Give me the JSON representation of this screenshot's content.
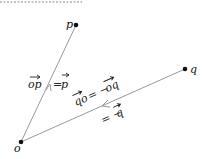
{
  "diagram": {
    "colors": {
      "line": "#9a9a9a",
      "point": "#111111",
      "text": "#222222",
      "dotted": "#b0b0b0"
    },
    "points": [
      {
        "id": "o",
        "label": "o",
        "x": 21,
        "y": 142
      },
      {
        "id": "p",
        "label": "p",
        "x": 76,
        "y": 25
      },
      {
        "id": "q",
        "label": "q",
        "x": 185,
        "y": 69
      }
    ],
    "segments": [
      {
        "from": "o",
        "to": "p",
        "arrow": "toward-p"
      },
      {
        "from": "q",
        "to": "o",
        "arrow": "toward-o"
      }
    ],
    "labels": {
      "op_vec": "op",
      "op_eq": "= ",
      "p_vec": "p",
      "qo_vec": "qo",
      "qo_eq": " = −",
      "oq_vec": "oq",
      "neg_q_eq": "= −",
      "q_vec": "q"
    }
  }
}
